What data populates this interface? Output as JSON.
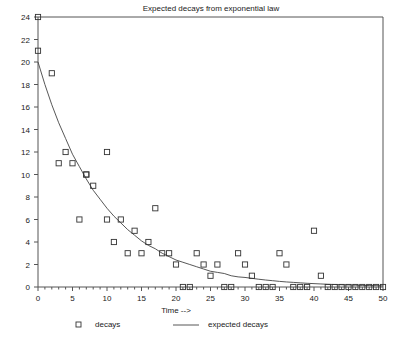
{
  "chart_data": {
    "type": "scatter",
    "title": "Expected decays from exponential law",
    "xlabel": "Time -->",
    "ylabel": "",
    "xlim": [
      0,
      50
    ],
    "ylim": [
      0,
      24
    ],
    "grid": false,
    "legend_position": "bottom",
    "x_ticks_major": [
      0,
      5,
      10,
      15,
      20,
      25,
      30,
      35,
      40,
      45,
      50
    ],
    "x_tick_labels": [
      "0",
      "5",
      "10",
      "15",
      "20",
      "25",
      "30",
      "35",
      "40",
      "45",
      "50"
    ],
    "x_minor_tick_step": 1,
    "y_ticks_major": [
      0,
      2,
      4,
      6,
      8,
      10,
      12,
      14,
      16,
      18,
      20,
      22,
      24
    ],
    "y_tick_labels": [
      "0",
      "2",
      "4",
      "6",
      "8",
      "10",
      "12",
      "14",
      "16",
      "18",
      "20",
      "22",
      "24"
    ],
    "series": [
      {
        "name": "decays",
        "type": "scatter",
        "marker": "open-square",
        "color": "#333333",
        "points": [
          [
            0,
            24
          ],
          [
            0,
            21
          ],
          [
            2,
            19
          ],
          [
            3,
            11
          ],
          [
            4,
            12
          ],
          [
            5,
            11
          ],
          [
            6,
            6
          ],
          [
            7,
            10
          ],
          [
            7,
            10
          ],
          [
            8,
            9
          ],
          [
            10,
            12
          ],
          [
            10,
            6
          ],
          [
            11,
            4
          ],
          [
            12,
            6
          ],
          [
            13,
            3
          ],
          [
            14,
            5
          ],
          [
            15,
            3
          ],
          [
            16,
            4
          ],
          [
            17,
            7
          ],
          [
            18,
            3
          ],
          [
            19,
            3
          ],
          [
            20,
            2
          ],
          [
            21,
            0
          ],
          [
            22,
            0
          ],
          [
            23,
            3
          ],
          [
            24,
            2
          ],
          [
            25,
            1
          ],
          [
            26,
            2
          ],
          [
            27,
            0
          ],
          [
            28,
            0
          ],
          [
            29,
            3
          ],
          [
            30,
            2
          ],
          [
            31,
            1
          ],
          [
            32,
            0
          ],
          [
            33,
            0
          ],
          [
            34,
            0
          ],
          [
            35,
            3
          ],
          [
            36,
            2
          ],
          [
            37,
            0
          ],
          [
            38,
            0
          ],
          [
            39,
            0
          ],
          [
            40,
            5
          ],
          [
            41,
            1
          ],
          [
            42,
            0
          ],
          [
            43,
            0
          ],
          [
            44,
            0
          ],
          [
            45,
            0
          ],
          [
            46,
            0
          ],
          [
            47,
            0
          ],
          [
            48,
            0
          ],
          [
            49,
            0
          ],
          [
            50,
            0
          ]
        ]
      },
      {
        "name": "expected decays",
        "type": "line",
        "color": "#444444",
        "model": "exponential",
        "amplitude": 20.0,
        "decay_constant": 0.105,
        "points": [
          [
            0,
            20.0
          ],
          [
            1,
            18.0
          ],
          [
            2,
            16.2
          ],
          [
            3,
            14.6
          ],
          [
            4,
            13.2
          ],
          [
            5,
            11.8
          ],
          [
            6,
            10.7
          ],
          [
            7,
            9.6
          ],
          [
            8,
            8.6
          ],
          [
            9,
            7.8
          ],
          [
            10,
            7.0
          ],
          [
            11,
            6.3
          ],
          [
            12,
            5.7
          ],
          [
            13,
            5.1
          ],
          [
            14,
            4.6
          ],
          [
            15,
            4.1
          ],
          [
            16,
            3.7
          ],
          [
            17,
            3.4
          ],
          [
            18,
            3.0
          ],
          [
            19,
            2.7
          ],
          [
            20,
            2.4
          ],
          [
            21,
            2.2
          ],
          [
            22,
            2.0
          ],
          [
            23,
            1.8
          ],
          [
            24,
            1.6
          ],
          [
            25,
            1.4
          ],
          [
            26,
            1.3
          ],
          [
            27,
            1.2
          ],
          [
            28,
            1.0
          ],
          [
            29,
            0.9
          ],
          [
            30,
            0.85
          ],
          [
            31,
            0.77
          ],
          [
            32,
            0.69
          ],
          [
            33,
            0.62
          ],
          [
            34,
            0.56
          ],
          [
            35,
            0.5
          ],
          [
            36,
            0.45
          ],
          [
            37,
            0.41
          ],
          [
            38,
            0.37
          ],
          [
            39,
            0.33
          ],
          [
            40,
            0.3
          ],
          [
            41,
            0.27
          ],
          [
            42,
            0.24
          ],
          [
            43,
            0.22
          ],
          [
            44,
            0.2
          ],
          [
            45,
            0.18
          ],
          [
            46,
            0.16
          ],
          [
            47,
            0.14
          ],
          [
            48,
            0.13
          ],
          [
            49,
            0.12
          ],
          [
            50,
            0.1
          ]
        ]
      }
    ],
    "legend": [
      {
        "label": "decays",
        "marker": "open-square"
      },
      {
        "label": "expected decays",
        "marker": "line"
      }
    ]
  }
}
